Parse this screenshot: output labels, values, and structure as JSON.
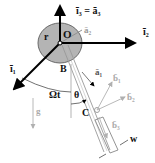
{
  "figure": {
    "labels": {
      "i3": "ī₃ = ā₃",
      "i2": "ī₂",
      "i1": "ī₁",
      "a2": "ā₂",
      "a1": "ā₁",
      "b1": "b̄₁",
      "b2": "b̄₂",
      "b3": "b̄₃",
      "O": "O",
      "r": "r",
      "B": "B",
      "C": "C",
      "w": "w",
      "g": "g",
      "omega_t": "Ωt",
      "theta": "θ"
    },
    "colors": {
      "disk_fill": "#b4b4b4",
      "disk_stroke": "#6a6a6a",
      "axis": "#000000",
      "faded": "#b0b0b0",
      "text_dark": "#111111",
      "text_faded": "#a8a8a8"
    }
  }
}
